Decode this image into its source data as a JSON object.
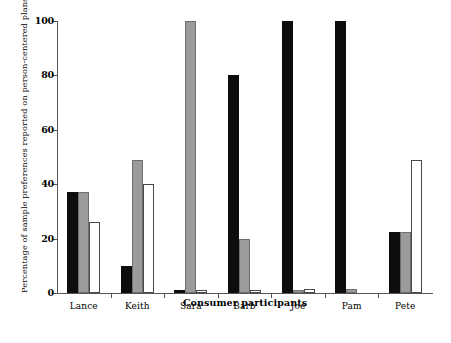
{
  "chart_data": {
    "type": "bar",
    "title": "",
    "subtitle": "",
    "xlabel": "Consumer participants",
    "ylabel": "Percentage of sample preferences reported on person-centered plans",
    "categories": [
      "Lance",
      "Keith",
      "Sara",
      "Barb",
      "Joe",
      "Pam",
      "Pete"
    ],
    "series": [
      {
        "name": "series-1",
        "color": "#0d0d0d",
        "style": "black",
        "values": [
          37,
          10,
          1,
          80,
          100,
          100,
          22.5
        ]
      },
      {
        "name": "series-2",
        "color": "#9b9b9b",
        "style": "gray",
        "values": [
          37,
          49,
          100,
          20,
          1,
          1.5,
          22.5
        ]
      },
      {
        "name": "series-3",
        "color": "#ffffff",
        "style": "white",
        "values": [
          26,
          40,
          1,
          1,
          1.5,
          0,
          49
        ]
      }
    ],
    "ylim": [
      0,
      100
    ],
    "yticks": [
      0,
      20,
      40,
      60,
      80,
      100
    ],
    "ytick_labels": [
      "0",
      "20",
      "40",
      "60",
      "80",
      "100"
    ],
    "grid": false,
    "legend": "none",
    "legend_position": "none"
  },
  "axis": {
    "y_title": "Percentage of sample preferences reported on person-centered plans",
    "x_title": "Consumer participants"
  }
}
